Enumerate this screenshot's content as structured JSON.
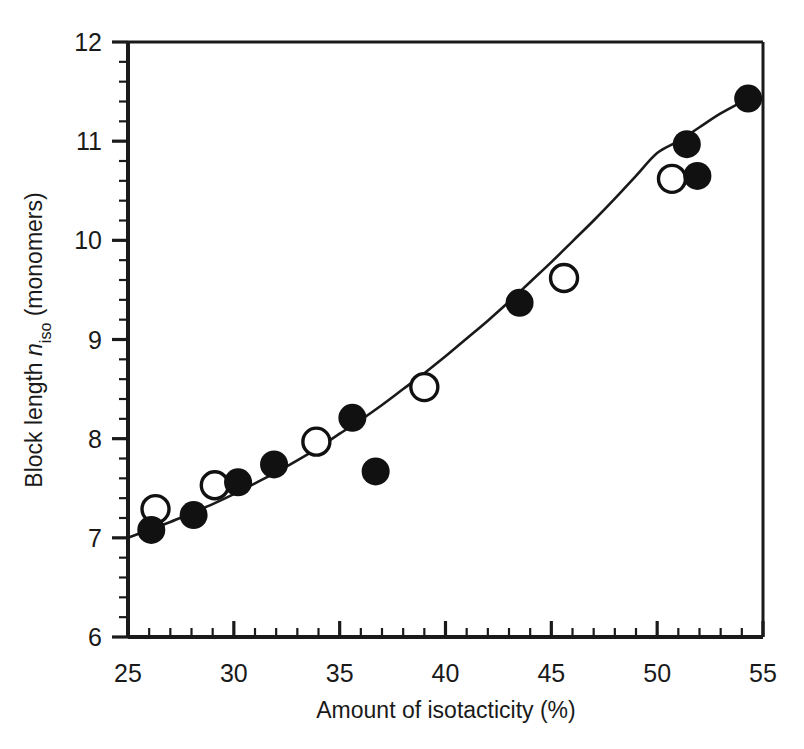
{
  "chart_data": {
    "type": "scatter",
    "title": "",
    "xlabel": "Amount of isotacticity (%)",
    "ylabel": "Block length n_iso (monomers)",
    "ylabel_parts": {
      "prefix": "Block length ",
      "italic_symbol": "n",
      "subscript": "iso",
      "suffix": " (monomers)"
    },
    "xlim": [
      25,
      55
    ],
    "ylim": [
      6,
      12
    ],
    "xticks": [
      25,
      30,
      35,
      40,
      45,
      50,
      55
    ],
    "xtick_labels": [
      "25",
      "30",
      "35",
      "40",
      "45",
      "50",
      "55"
    ],
    "yticks": [
      6,
      7,
      8,
      9,
      10,
      11,
      12
    ],
    "ytick_labels": [
      "6",
      "7",
      "8",
      "9",
      "10",
      "11",
      "12"
    ],
    "x_minor_interval": 1,
    "y_minor_interval": 0.2,
    "grid": false,
    "legend": false,
    "legend_position": "none",
    "series": [
      {
        "name": "filled-circles",
        "marker": "filled circle",
        "color": "#111111",
        "points": [
          {
            "x": 26.1,
            "y": 7.08
          },
          {
            "x": 28.1,
            "y": 7.23
          },
          {
            "x": 30.2,
            "y": 7.56
          },
          {
            "x": 31.9,
            "y": 7.74
          },
          {
            "x": 35.6,
            "y": 8.21
          },
          {
            "x": 36.7,
            "y": 7.67
          },
          {
            "x": 43.5,
            "y": 9.37
          },
          {
            "x": 51.4,
            "y": 10.97
          },
          {
            "x": 51.9,
            "y": 10.65
          },
          {
            "x": 54.3,
            "y": 11.43
          }
        ]
      },
      {
        "name": "open-circles",
        "marker": "open circle",
        "color": "#ffffff",
        "edge_color": "#111111",
        "points": [
          {
            "x": 26.3,
            "y": 7.29
          },
          {
            "x": 29.1,
            "y": 7.53
          },
          {
            "x": 33.9,
            "y": 7.97
          },
          {
            "x": 39.0,
            "y": 8.52
          },
          {
            "x": 45.6,
            "y": 9.62
          },
          {
            "x": 50.7,
            "y": 10.62
          }
        ]
      },
      {
        "name": "fit-curve",
        "marker": "none",
        "line": "solid",
        "color": "#1a1a1a",
        "points": [
          {
            "x": 25.0,
            "y": 7.0
          },
          {
            "x": 26.0,
            "y": 7.08
          },
          {
            "x": 27.0,
            "y": 7.16
          },
          {
            "x": 28.0,
            "y": 7.25
          },
          {
            "x": 29.0,
            "y": 7.34
          },
          {
            "x": 30.0,
            "y": 7.44
          },
          {
            "x": 31.0,
            "y": 7.55
          },
          {
            "x": 32.0,
            "y": 7.66
          },
          {
            "x": 33.0,
            "y": 7.78
          },
          {
            "x": 34.0,
            "y": 7.91
          },
          {
            "x": 35.0,
            "y": 8.05
          },
          {
            "x": 36.0,
            "y": 8.19
          },
          {
            "x": 37.0,
            "y": 8.34
          },
          {
            "x": 38.0,
            "y": 8.5
          },
          {
            "x": 39.0,
            "y": 8.66
          },
          {
            "x": 40.0,
            "y": 8.83
          },
          {
            "x": 41.0,
            "y": 9.01
          },
          {
            "x": 42.0,
            "y": 9.19
          },
          {
            "x": 43.0,
            "y": 9.38
          },
          {
            "x": 44.0,
            "y": 9.58
          },
          {
            "x": 45.0,
            "y": 9.78
          },
          {
            "x": 46.0,
            "y": 9.99
          },
          {
            "x": 47.0,
            "y": 10.2
          },
          {
            "x": 48.0,
            "y": 10.42
          },
          {
            "x": 49.0,
            "y": 10.65
          },
          {
            "x": 50.0,
            "y": 10.88
          },
          {
            "x": 51.0,
            "y": 11.0
          },
          {
            "x": 52.0,
            "y": 11.14
          },
          {
            "x": 53.0,
            "y": 11.28
          },
          {
            "x": 54.3,
            "y": 11.43
          }
        ]
      }
    ]
  }
}
